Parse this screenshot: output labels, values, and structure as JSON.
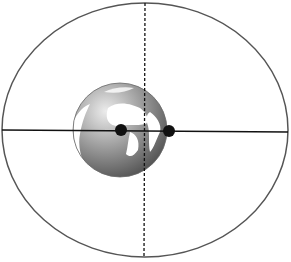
{
  "diagram": {
    "type": "elliptical-orbit",
    "ellipse": {
      "cx": 145,
      "cy": 130,
      "rx": 143,
      "ry": 127,
      "stroke": "#555555"
    },
    "major_axis": {
      "style": "solid",
      "color": "#111111"
    },
    "minor_axis": {
      "style": "dashed",
      "color": "#111111"
    },
    "body": {
      "name": "earth-globe",
      "cx": 120,
      "cy": 130,
      "r": 47
    },
    "foci": [
      {
        "name": "focus-1",
        "cx": 121,
        "cy": 130,
        "r": 6
      },
      {
        "name": "focus-2",
        "cx": 169,
        "cy": 131,
        "r": 6
      }
    ],
    "colors": {
      "background": "#ffffff",
      "globe_light": "#e8e8e8",
      "globe_dark": "#5a5a5a",
      "land_light": "#ffffff"
    }
  }
}
